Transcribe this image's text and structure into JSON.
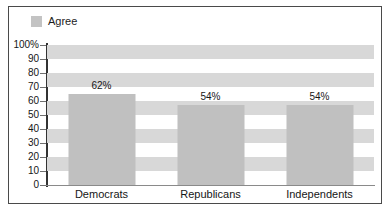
{
  "chart_data": {
    "type": "bar",
    "title": "",
    "subtitle": "",
    "xlabel": "",
    "ylabel": "",
    "categories": [
      "Democrats",
      "Republicans",
      "Independents"
    ],
    "values": [
      62,
      54,
      54
    ],
    "value_labels": [
      "62%",
      "54%",
      "54%"
    ],
    "series": [
      {
        "name": "Agree",
        "values": [
          62,
          54,
          54
        ]
      }
    ],
    "ylim": [
      0,
      100
    ],
    "y_ticks": [
      0,
      10,
      20,
      30,
      40,
      50,
      60,
      70,
      80,
      90,
      100
    ],
    "y_tick_labels": [
      "0",
      "10",
      "20",
      "30",
      "40",
      "50",
      "60",
      "70",
      "80",
      "90",
      "100%"
    ],
    "grid": "alternating-horizontal-bands",
    "legend_position": "top-left",
    "legend": [
      {
        "label": "Agree",
        "color": "#c3c3c3",
        "swatch": "legend-swatch-agree"
      }
    ],
    "colors": {
      "bar_fill": "#c0c0c0",
      "band_fill": "#d8d8d8",
      "plot_background": "#ffffff",
      "axis": "#333333",
      "frame_border": "#4a4a4a",
      "text": "#161616"
    }
  }
}
